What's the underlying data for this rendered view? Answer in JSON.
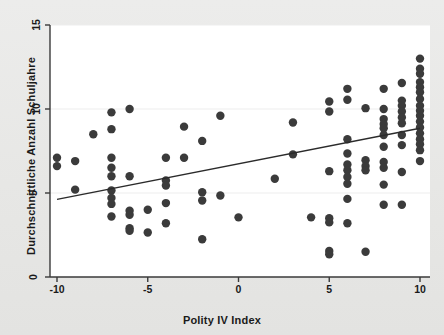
{
  "figure": {
    "background_color": "#e9e9e7",
    "plot_background_color": "#ffffff",
    "axis_color": "#3a3a3a",
    "point_color": "#3b3b3b",
    "line_color": "#2b2b2b",
    "gridline_color": "#ededed"
  },
  "chart_data": {
    "type": "scatter",
    "title": "",
    "xlabel": "Polity IV Index",
    "ylabel": "Durchschnittliche Anzahl Schuljahre",
    "xlim": [
      -10,
      10
    ],
    "ylim": [
      0,
      15
    ],
    "xticks": [
      -10,
      -5,
      0,
      5,
      10
    ],
    "xtick_labels": [
      "-10",
      "-5",
      "0",
      "5",
      "10"
    ],
    "yticks": [
      0,
      5,
      10,
      15
    ],
    "ytick_labels": [
      "0",
      "5",
      "10",
      "15"
    ],
    "grid": true,
    "gridlines_y": [
      5,
      10,
      15
    ],
    "legend": null,
    "legend_position": "none",
    "marker": "circle",
    "marker_size": 4.2,
    "points": [
      [
        -10,
        7.1
      ],
      [
        -10,
        6.6
      ],
      [
        -9,
        6.9
      ],
      [
        -9,
        5.2
      ],
      [
        -8,
        8.5
      ],
      [
        -7,
        9.8
      ],
      [
        -7,
        8.8
      ],
      [
        -7,
        7.1
      ],
      [
        -7,
        6.5
      ],
      [
        -7,
        6.0
      ],
      [
        -7,
        5.15
      ],
      [
        -7,
        4.7
      ],
      [
        -7,
        4.35
      ],
      [
        -7,
        3.6
      ],
      [
        -6,
        10.0
      ],
      [
        -6,
        6.0
      ],
      [
        -6,
        3.95
      ],
      [
        -6,
        3.7
      ],
      [
        -6,
        2.9
      ],
      [
        -6,
        2.75
      ],
      [
        -5,
        4.0
      ],
      [
        -5,
        2.65
      ],
      [
        -4,
        7.1
      ],
      [
        -4,
        5.75
      ],
      [
        -4,
        5.45
      ],
      [
        -4,
        4.4
      ],
      [
        -4,
        3.2
      ],
      [
        -3,
        8.95
      ],
      [
        -3,
        7.1
      ],
      [
        -2,
        8.1
      ],
      [
        -2,
        5.05
      ],
      [
        -2,
        4.55
      ],
      [
        -2,
        2.25
      ],
      [
        -1,
        9.6
      ],
      [
        -1,
        4.85
      ],
      [
        0,
        3.55
      ],
      [
        2,
        5.85
      ],
      [
        3,
        9.2
      ],
      [
        3,
        7.3
      ],
      [
        4,
        3.55
      ],
      [
        5,
        10.45
      ],
      [
        5,
        9.85
      ],
      [
        5,
        6.3
      ],
      [
        5,
        3.5
      ],
      [
        5,
        3.25
      ],
      [
        5,
        1.55
      ],
      [
        5,
        1.35
      ],
      [
        6,
        11.2
      ],
      [
        6,
        10.55
      ],
      [
        6,
        8.2
      ],
      [
        6,
        7.35
      ],
      [
        6,
        6.7
      ],
      [
        6,
        6.35
      ],
      [
        6,
        5.95
      ],
      [
        6,
        5.55
      ],
      [
        6,
        4.65
      ],
      [
        6,
        3.2
      ],
      [
        7,
        10.05
      ],
      [
        7,
        6.95
      ],
      [
        7,
        6.6
      ],
      [
        7,
        6.35
      ],
      [
        7,
        1.5
      ],
      [
        8,
        11.2
      ],
      [
        8,
        10.0
      ],
      [
        8,
        9.4
      ],
      [
        8,
        9.1
      ],
      [
        8,
        8.85
      ],
      [
        8,
        8.45
      ],
      [
        8,
        7.75
      ],
      [
        8,
        6.85
      ],
      [
        8,
        6.5
      ],
      [
        8,
        5.5
      ],
      [
        8,
        4.3
      ],
      [
        9,
        11.55
      ],
      [
        9,
        10.5
      ],
      [
        9,
        10.2
      ],
      [
        9,
        9.85
      ],
      [
        9,
        9.5
      ],
      [
        9,
        9.15
      ],
      [
        9,
        8.45
      ],
      [
        9,
        7.85
      ],
      [
        9,
        6.25
      ],
      [
        9,
        4.3
      ],
      [
        10,
        13.0
      ],
      [
        10,
        12.4
      ],
      [
        10,
        12.1
      ],
      [
        10,
        11.6
      ],
      [
        10,
        11.3
      ],
      [
        10,
        11.0
      ],
      [
        10,
        10.6
      ],
      [
        10,
        10.2
      ],
      [
        10,
        9.9
      ],
      [
        10,
        9.6
      ],
      [
        10,
        9.25
      ],
      [
        10,
        8.9
      ],
      [
        10,
        8.55
      ],
      [
        10,
        8.2
      ],
      [
        10,
        7.9
      ],
      [
        10,
        7.55
      ],
      [
        10,
        6.9
      ]
    ],
    "fit_line": {
      "name": "linear-fit",
      "x": [
        -10,
        10
      ],
      "y": [
        4.62,
        8.85
      ]
    }
  }
}
